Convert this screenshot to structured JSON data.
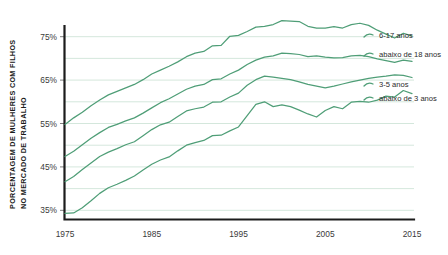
{
  "chart_data": {
    "type": "line",
    "title": "",
    "xlabel": "",
    "ylabel": "PORCENTAGEM DE MULHERES COM FILHOS NO MERCADO DE TRABALHO",
    "ylabel_line1": "PORCENTAGEM DE MULHERES COM FILHOS",
    "ylabel_line2": "NO MERCADO DE TRABALHO",
    "xlim": [
      1975,
      2015
    ],
    "ylim": [
      33,
      80
    ],
    "grid": true,
    "grid_axis": "y",
    "legend_position": "right",
    "line_color": "#4f9e77",
    "grid_color": "#cfe4d8",
    "axis_color": "#1c1c1c",
    "xticks": [
      1975,
      1985,
      1995,
      2005,
      2015
    ],
    "xticklabels": [
      "1975",
      "1985",
      "1995",
      "2005",
      "2015"
    ],
    "yticks": [
      35,
      45,
      55,
      65,
      75
    ],
    "yticklabels": [
      "35%",
      "45%",
      "55%",
      "65%",
      "75%"
    ],
    "ygridlines": [
      35,
      40,
      45,
      50,
      55,
      60,
      65,
      70,
      75
    ],
    "x": [
      1975,
      1976,
      1977,
      1978,
      1979,
      1980,
      1981,
      1982,
      1983,
      1984,
      1985,
      1986,
      1987,
      1988,
      1989,
      1990,
      1991,
      1992,
      1993,
      1994,
      1995,
      1996,
      1997,
      1998,
      1999,
      2000,
      2001,
      2002,
      2003,
      2004,
      2005,
      2006,
      2007,
      2008,
      2009,
      2010,
      2011,
      2012,
      2013,
      2014,
      2015
    ],
    "series": [
      {
        "name": "6-17 anos",
        "legend_label": "6-17 anos",
        "color": "#4f9e77",
        "values": [
          54.8,
          56.3,
          57.6,
          59.1,
          60.4,
          61.6,
          62.4,
          63.2,
          64.0,
          65.1,
          66.4,
          67.3,
          68.2,
          69.2,
          70.4,
          71.2,
          71.6,
          72.9,
          73.0,
          75.1,
          75.3,
          76.2,
          77.2,
          77.4,
          77.8,
          78.7,
          78.6,
          78.5,
          77.4,
          77.0,
          77.0,
          77.3,
          77.0,
          77.8,
          78.1,
          77.6,
          76.5,
          75.6,
          74.7,
          75.8,
          75.2
        ]
      },
      {
        "name": "abaixo de 18 anos",
        "legend_label": "abaixo de 18 anos",
        "color": "#4f9e77",
        "values": [
          47.4,
          48.6,
          50.1,
          51.6,
          52.9,
          54.1,
          54.8,
          55.6,
          56.3,
          57.4,
          58.6,
          59.8,
          60.7,
          61.8,
          62.9,
          63.6,
          64.0,
          65.1,
          65.3,
          66.4,
          67.3,
          68.6,
          69.6,
          70.3,
          70.6,
          71.2,
          71.1,
          70.9,
          70.4,
          70.6,
          70.3,
          70.1,
          70.2,
          70.6,
          70.7,
          70.4,
          69.9,
          69.5,
          69.1,
          69.6,
          69.3
        ]
      },
      {
        "name": "3-5 anos",
        "legend_label": "3-5 anos",
        "color": "#4f9e77",
        "values": [
          41.6,
          42.8,
          44.4,
          45.9,
          47.4,
          48.4,
          49.2,
          50.1,
          50.8,
          52.2,
          53.6,
          54.7,
          55.3,
          56.6,
          57.9,
          58.4,
          58.8,
          59.9,
          60.0,
          61.1,
          62.0,
          63.8,
          65.1,
          65.9,
          65.7,
          65.4,
          65.1,
          64.6,
          64.0,
          63.6,
          63.2,
          63.6,
          64.1,
          64.6,
          65.0,
          65.4,
          65.7,
          65.9,
          66.2,
          66.1,
          65.6
        ]
      },
      {
        "name": "abaixo de 3 anos",
        "legend_label": "abaixo de 3 anos",
        "color": "#4f9e77",
        "values": [
          34.3,
          34.4,
          35.6,
          37.2,
          38.9,
          40.2,
          41.0,
          41.9,
          42.9,
          44.3,
          45.6,
          46.6,
          47.3,
          48.7,
          50.0,
          50.6,
          51.1,
          52.2,
          52.3,
          53.3,
          54.2,
          56.8,
          59.4,
          60.0,
          58.9,
          59.3,
          58.9,
          58.1,
          57.2,
          56.5,
          58.0,
          58.9,
          58.4,
          59.9,
          60.1,
          59.9,
          60.4,
          61.3,
          61.1,
          62.6,
          61.9
        ]
      }
    ]
  }
}
